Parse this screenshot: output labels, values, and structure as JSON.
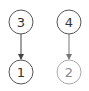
{
  "diagram": {
    "type": "directed-graph",
    "nodes": [
      {
        "id": "3",
        "label": "3",
        "cx": 21,
        "cy": 22,
        "r": 12,
        "stroke": "#555555",
        "text_color": "#333333"
      },
      {
        "id": "4",
        "label": "4",
        "cx": 69,
        "cy": 22,
        "r": 12,
        "stroke": "#555555",
        "text_color": "#333333"
      },
      {
        "id": "1",
        "label": "1",
        "cx": 21,
        "cy": 72,
        "r": 12,
        "stroke": "#555555",
        "text_color": "#333333"
      },
      {
        "id": "2",
        "label": "2",
        "cx": 69,
        "cy": 72,
        "r": 12,
        "stroke": "#aaaaaa",
        "text_color": "#888888"
      }
    ],
    "edges": [
      {
        "from": "3",
        "to": "1",
        "color": "#444444"
      },
      {
        "from": "4",
        "to": "2",
        "color": "#777777"
      }
    ]
  }
}
